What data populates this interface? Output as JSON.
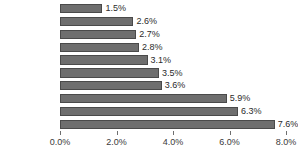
{
  "chart_data": {
    "type": "bar",
    "orientation": "horizontal",
    "title": "",
    "subtitle": "",
    "xlabel": "",
    "ylabel": "",
    "categories": [
      "ミャンマー",
      "カンボジア",
      "フィリピン",
      "ラオス",
      "シンガポール",
      "ブルネイ",
      "インドネシア",
      "マレーシア",
      "ベトナム",
      "タイ"
    ],
    "values": [
      1.5,
      2.6,
      2.7,
      2.8,
      3.1,
      3.5,
      3.6,
      5.9,
      6.3,
      7.6
    ],
    "data_labels": [
      "1.5%",
      "2.6%",
      "2.7%",
      "2.8%",
      "3.1%",
      "3.5%",
      "3.6%",
      "5.9%",
      "6.3%",
      "7.6%"
    ],
    "xlim": [
      0.0,
      8.0
    ],
    "xticks": [
      0.0,
      2.0,
      4.0,
      6.0,
      8.0
    ],
    "xtick_labels": [
      "0.0%",
      "2.0%",
      "4.0%",
      "6.0%",
      "8.0%"
    ],
    "grid": false,
    "legend": null,
    "colors": {
      "bar_fill": "#6e6e6e",
      "bar_stroke": "#4a4a4a",
      "axis": "#6f6f6f",
      "text": "#2b2b2b",
      "background": "#ffffff"
    }
  }
}
